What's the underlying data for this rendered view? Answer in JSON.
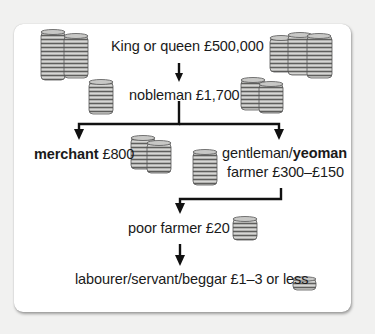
{
  "diagram": {
    "type": "hierarchy",
    "title": "",
    "levels": [
      {
        "id": "king",
        "label": "King or queen £500,000",
        "role": "King or queen",
        "income": "£500,000"
      },
      {
        "id": "nobleman",
        "label": "nobleman £1,700",
        "role": "nobleman",
        "income": "£1,700"
      },
      {
        "id": "merchant",
        "role": "merchant",
        "income": "£800"
      },
      {
        "id": "gentleman",
        "role_part1": "gentleman/",
        "role_part2": "yeoman",
        "line2": "farmer £300–£150",
        "income": "£300–£150"
      },
      {
        "id": "poor_farmer",
        "label": "poor farmer £20",
        "role": "poor farmer",
        "income": "£20"
      },
      {
        "id": "labourer",
        "label": "labourer/servant/beggar £1–3 or less",
        "role": "labourer/servant/beggar",
        "income": "£1–3 or less"
      }
    ],
    "edges": [
      [
        "king",
        "nobleman"
      ],
      [
        "nobleman",
        "merchant"
      ],
      [
        "nobleman",
        "gentleman"
      ],
      [
        "gentleman",
        "poor_farmer"
      ],
      [
        "poor_farmer",
        "labourer"
      ]
    ],
    "icons": {
      "coin_stack": "coin-stack-icon"
    },
    "colors": {
      "background": "#f1f1f0",
      "card": "#ffffff",
      "text": "#1a1a1a",
      "arrow": "#111111",
      "coin_fill": "#a8a8a6",
      "coin_edge": "#5a5a58"
    }
  }
}
